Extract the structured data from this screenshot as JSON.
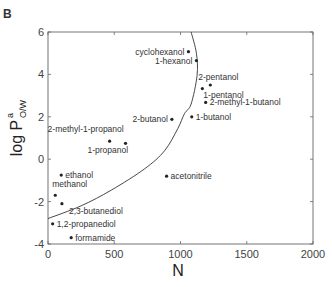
{
  "chart_data": {
    "type": "scatter",
    "panel_label": "B",
    "title": "",
    "xlabel": "N",
    "ylabel": "log P",
    "ylabel_superscript": "a",
    "ylabel_subscript": "O/W",
    "xlim": [
      0,
      2000
    ],
    "ylim": [
      -4,
      6
    ],
    "x_ticks": [
      0,
      500,
      1000,
      1500,
      2000
    ],
    "y_ticks": [
      -4,
      -2,
      0,
      2,
      4,
      6
    ],
    "grid": false,
    "legend": null,
    "points": [
      {
        "name": "cyclohexanol",
        "x": 1060,
        "y": 5.07,
        "label_side": "left"
      },
      {
        "name": "1-hexanol",
        "x": 1120,
        "y": 4.65,
        "label_side": "left"
      },
      {
        "name": "2-pentanol",
        "x": 1225,
        "y": 3.5,
        "label_side": "above"
      },
      {
        "name": "1-pentanol",
        "x": 1165,
        "y": 3.33,
        "label_side": "right-below"
      },
      {
        "name": "2-methyl-1-butanol",
        "x": 1190,
        "y": 2.68,
        "label_side": "right"
      },
      {
        "name": "1-butanol",
        "x": 1085,
        "y": 2.0,
        "label_side": "right"
      },
      {
        "name": "2-butanol",
        "x": 935,
        "y": 1.88,
        "label_side": "left"
      },
      {
        "name": "2-methyl-1-propanol",
        "x": 465,
        "y": 0.85,
        "label_side": "above-left"
      },
      {
        "name": "1-propanol",
        "x": 585,
        "y": 0.75,
        "label_side": "below-left"
      },
      {
        "name": "ethanol",
        "x": 100,
        "y": -0.75,
        "label_side": "right"
      },
      {
        "name": "methanol",
        "x": 55,
        "y": -1.7,
        "label_side": "above"
      },
      {
        "name": "2,3-butanediol",
        "x": 105,
        "y": -2.1,
        "label_side": "below-right"
      },
      {
        "name": "1,2-propanediol",
        "x": 35,
        "y": -3.05,
        "label_side": "right"
      },
      {
        "name": "formamide",
        "x": 175,
        "y": -3.7,
        "label_side": "right"
      },
      {
        "name": "acetonitrile",
        "x": 895,
        "y": -0.8,
        "label_side": "right"
      }
    ],
    "curve": {
      "description": "fitted boundary curve",
      "points": [
        [
          0,
          -2.8
        ],
        [
          250,
          -2.2
        ],
        [
          480,
          -1.45
        ],
        [
          730,
          -0.45
        ],
        [
          880,
          0.4
        ],
        [
          980,
          1.45
        ],
        [
          1030,
          2.15
        ],
        [
          1080,
          2.6
        ],
        [
          1125,
          3.95
        ],
        [
          1120,
          5.0
        ],
        [
          1080,
          6.0
        ]
      ]
    }
  }
}
